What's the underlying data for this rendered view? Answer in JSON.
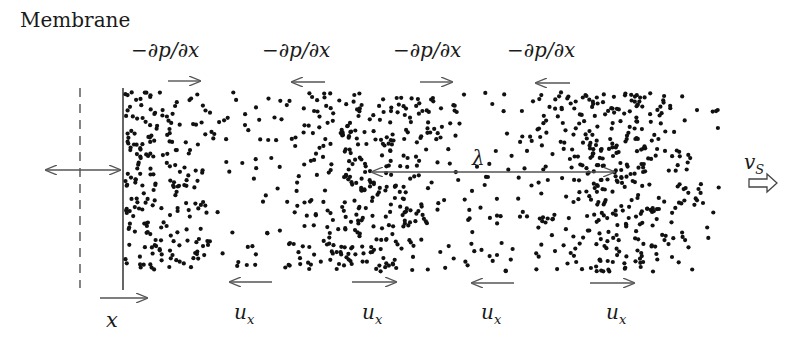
{
  "labels": {
    "membrane": "Membrane",
    "pressure_gradient": [
      "−∂p/∂x",
      "−∂p/∂x",
      "−∂p/∂x",
      "−∂p/∂x"
    ],
    "velocity": [
      "u",
      "u",
      "u",
      "u"
    ],
    "velocity_sub": "x",
    "position": "x",
    "wavelength": "λ",
    "sound_speed": "v",
    "sound_speed_sub": "S"
  },
  "arrows": {
    "pressure_gradient_directions": [
      "right",
      "left",
      "right",
      "left"
    ],
    "velocity_directions": [
      "left",
      "right",
      "left",
      "right"
    ],
    "membrane_oscillation": "both",
    "propagation": "right"
  },
  "density_profile": {
    "compression_centers_x": [
      123,
      370,
      612
    ],
    "rarefaction_centers_x": [
      250,
      490
    ],
    "region": {
      "x0": 123,
      "x1": 720,
      "y0": 92,
      "y1": 272
    }
  },
  "colors": {
    "ink": "#1a1a1a",
    "arrow": "#555555",
    "background": "#ffffff"
  }
}
